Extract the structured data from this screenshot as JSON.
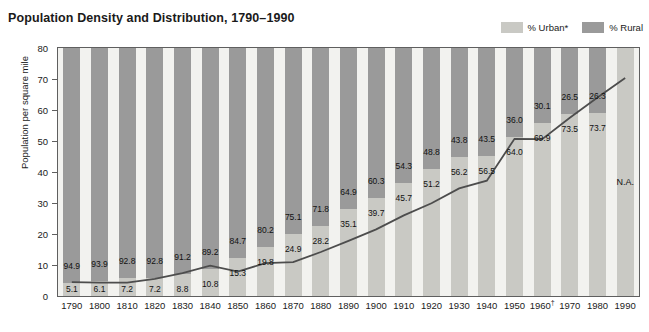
{
  "header": {
    "title": "Population Density and Distribution, 1790–1990"
  },
  "legend": {
    "position": "top-right",
    "items": [
      {
        "label": "% Urban*",
        "color": "#c9c9c4",
        "name": "urban"
      },
      {
        "label": "% Rural",
        "color": "#9a9a9a",
        "name": "rural"
      }
    ]
  },
  "axes": {
    "y_title": "Population per square mile",
    "y_ticks": [
      "80",
      "70",
      "60",
      "50",
      "40",
      "30",
      "20",
      "10",
      "0"
    ],
    "y_min": 0,
    "y_max": 80,
    "x_ticks": [
      "1790",
      "1800",
      "1810",
      "1820",
      "1830",
      "1840",
      "1850",
      "1860",
      "1870",
      "1880",
      "1890",
      "1900",
      "1910",
      "1920",
      "1930",
      "1940",
      "1950",
      "1960†",
      "1970",
      "1980",
      "1990"
    ]
  },
  "footnotes": {
    "dagger_year": "1960†",
    "urban_asterisk": "*"
  },
  "caption": "",
  "chart_data": {
    "type": "bar",
    "title": "Population Density and Distribution, 1790–1990",
    "xlabel": "",
    "ylabel": "Population per square mile",
    "ylim": [
      0,
      80
    ],
    "grid": false,
    "legend_position": "top-right",
    "categories": [
      "1790",
      "1800",
      "1810",
      "1820",
      "1830",
      "1840",
      "1850",
      "1860",
      "1870",
      "1880",
      "1890",
      "1900",
      "1910",
      "1920",
      "1930",
      "1940",
      "1950",
      "1960†",
      "1970",
      "1980",
      "1990"
    ],
    "series": [
      {
        "name": "% Urban*",
        "type": "bar-stacked",
        "color": "#c9c9c4",
        "values": [
          5.1,
          6.1,
          7.2,
          7.2,
          8.8,
          10.8,
          15.3,
          19.8,
          24.9,
          28.2,
          35.1,
          39.7,
          45.7,
          51.2,
          56.2,
          56.5,
          64.0,
          69.9,
          73.5,
          73.7,
          null
        ],
        "labels": [
          "5.1",
          "6.1",
          "7.2",
          "7.2",
          "8.8",
          "10.8",
          "15.3",
          "19.8",
          "24.9",
          "28.2",
          "35.1",
          "39.7",
          "45.7",
          "51.2",
          "56.2",
          "56.5",
          "64.0",
          "69.9",
          "73.5",
          "73.7",
          "N.A."
        ]
      },
      {
        "name": "% Rural",
        "type": "bar-stacked",
        "color": "#9a9a9a",
        "values": [
          94.9,
          93.9,
          92.8,
          92.8,
          91.2,
          89.2,
          84.7,
          80.2,
          75.1,
          71.8,
          64.9,
          60.3,
          54.3,
          48.8,
          43.8,
          43.5,
          36.0,
          30.1,
          26.5,
          26.3,
          null
        ],
        "labels": [
          "94.9",
          "93.9",
          "92.8",
          "92.8",
          "91.2",
          "89.2",
          "84.7",
          "80.2",
          "75.1",
          "71.8",
          "64.9",
          "60.3",
          "54.3",
          "48.8",
          "43.8",
          "43.5",
          "36.0",
          "30.1",
          "26.5",
          "26.3",
          "N.A."
        ]
      },
      {
        "name": "Population per square mile",
        "type": "line",
        "color": "#4d4d4d",
        "values": [
          4.5,
          4.3,
          4.3,
          5.5,
          7.4,
          9.8,
          7.9,
          10.6,
          10.9,
          14.2,
          17.8,
          21.5,
          26.0,
          29.9,
          34.7,
          37.2,
          50.7,
          50.6,
          57.5,
          64.0,
          70.3
        ]
      }
    ]
  }
}
